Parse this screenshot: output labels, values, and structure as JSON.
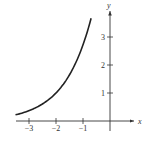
{
  "chart_data": {
    "type": "line",
    "title": "",
    "xlabel": "x",
    "ylabel": "y",
    "xlim": [
      -3.5,
      0.9
    ],
    "ylim": [
      -0.3,
      4.0
    ],
    "grid": false,
    "x_ticks": [
      -3,
      -2,
      -1
    ],
    "x_tick_labels": [
      "−3",
      "−2",
      "−1"
    ],
    "y_ticks": [
      1,
      2,
      3
    ],
    "y_tick_labels": [
      "1",
      "2",
      "3"
    ],
    "series": [
      {
        "name": "curve",
        "color": "#222222",
        "x": [
          -3.5,
          -3.0,
          -2.5,
          -2.0,
          -1.5,
          -1.0,
          -0.7
        ],
        "y": [
          0.22,
          0.37,
          0.61,
          1.0,
          1.65,
          2.72,
          3.67
        ]
      }
    ]
  },
  "axes": {
    "x_label": "x",
    "y_label": "y"
  }
}
